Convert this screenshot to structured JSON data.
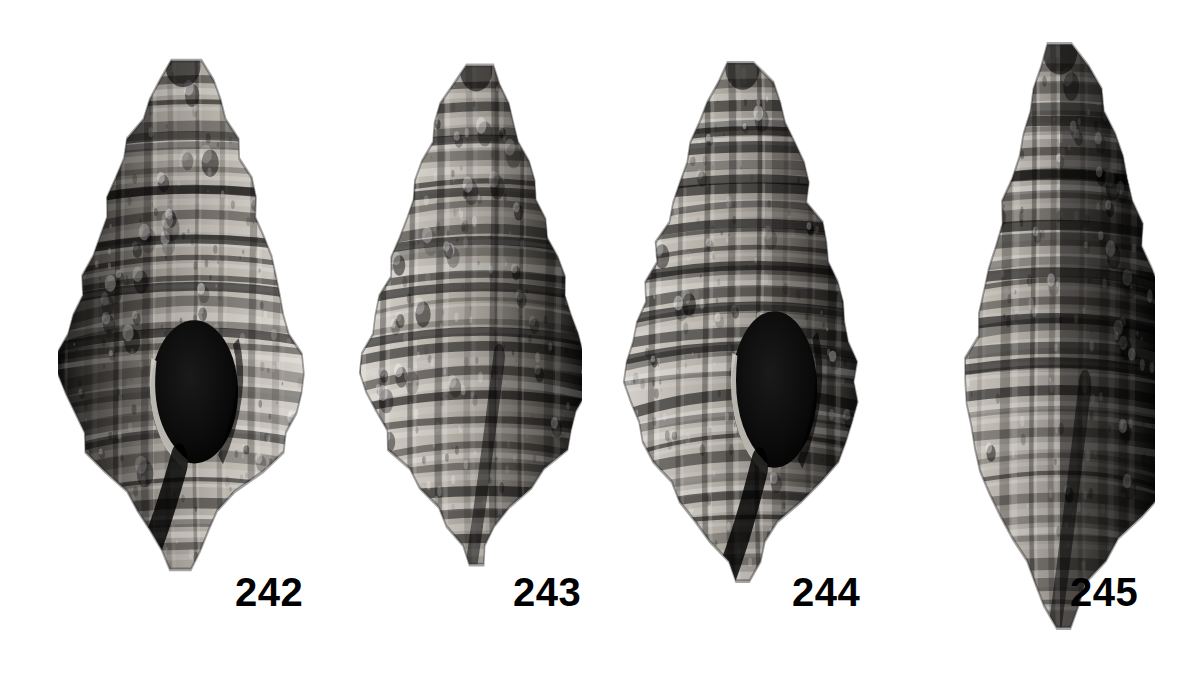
{
  "plate": {
    "background_color": "#ffffff",
    "ink_color": "#000000",
    "width": 1203,
    "height": 686,
    "medium": "halftone black-and-white photographic plate",
    "subject": "fossil gastropod shells",
    "specimen_count": 4
  },
  "labels": [
    {
      "text": "242",
      "x": 235,
      "y": 572
    },
    {
      "text": "243",
      "x": 513,
      "y": 572
    },
    {
      "text": "244",
      "x": 792,
      "y": 572
    },
    {
      "text": "245",
      "x": 1070,
      "y": 572
    }
  ],
  "specimens": [
    {
      "id": "specimen-242",
      "label": "242",
      "view": "apertural",
      "x": 58,
      "y": 50,
      "w": 250,
      "h": 530,
      "aperture": {
        "visible": true,
        "fill": "#090909",
        "cx": 0.545,
        "cy": 0.645,
        "rx": 0.175,
        "ry": 0.135
      },
      "shadow_side": "left",
      "tones": {
        "highlight": "#d8d4cd",
        "light": "#b5b0a8",
        "mid": "#8b8680",
        "dark": "#4a4743",
        "darkest": "#141414"
      },
      "whorls": 6,
      "spiral_cords": 22,
      "axial_ribs": 9,
      "siphonal_canal": "long, narrow, deflected left"
    },
    {
      "id": "specimen-243",
      "label": "243",
      "view": "abapertural",
      "x": 352,
      "y": 55,
      "w": 230,
      "h": 520,
      "aperture": {
        "visible": false,
        "fill": "#090909",
        "cx": 0.5,
        "cy": 0.62,
        "rx": 0.0,
        "ry": 0.0
      },
      "shadow_side": "right",
      "tones": {
        "highlight": "#dbd7d0",
        "light": "#b8b3ab",
        "mid": "#8e8982",
        "dark": "#4d4a46",
        "darkest": "#161616"
      },
      "whorls": 6,
      "spiral_cords": 20,
      "axial_ribs": 8,
      "siphonal_canal": "short, bent left"
    },
    {
      "id": "specimen-244",
      "label": "244",
      "view": "apertural",
      "x": 620,
      "y": 52,
      "w": 245,
      "h": 540,
      "aperture": {
        "visible": true,
        "fill": "#0b0b0b",
        "cx": 0.63,
        "cy": 0.625,
        "rx": 0.175,
        "ry": 0.145
      },
      "shadow_side": "right",
      "tones": {
        "highlight": "#d6d2cb",
        "light": "#b2ada5",
        "mid": "#87827c",
        "dark": "#474440",
        "darkest": "#121212"
      },
      "whorls": 7,
      "spiral_cords": 24,
      "axial_ribs": 9,
      "siphonal_canal": "long, narrow, deflected left"
    },
    {
      "id": "specimen-245",
      "label": "245",
      "view": "lateral-oblique",
      "x": 905,
      "y": 32,
      "w": 250,
      "h": 608,
      "aperture": {
        "visible": false,
        "fill": "#0a0a0a",
        "cx": 0.72,
        "cy": 0.55,
        "rx": 0.0,
        "ry": 0.0
      },
      "shadow_side": "right",
      "tones": {
        "highlight": "#dedad3",
        "light": "#bab5ad",
        "mid": "#8c8781",
        "dark": "#44413d",
        "darkest": "#0f0f0f"
      },
      "whorls": 7,
      "spiral_cords": 26,
      "axial_ribs": 10,
      "siphonal_canal": "long, tapering, straight"
    }
  ]
}
